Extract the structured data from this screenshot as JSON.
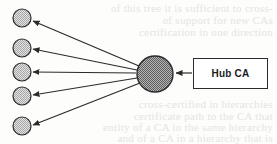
{
  "figure": {
    "background_color": "#fdfdfc",
    "stroke_color": "#2b2b2b",
    "hub_fill": "#8f8f8f",
    "spoke_fill": "#c9c9c9"
  },
  "hub": {
    "label": "Hub CA",
    "node_name": "hub-ca-node",
    "cx": 155,
    "cy": 74,
    "r": 18,
    "fill": "#8f8f8f"
  },
  "hub_label_box": {
    "text": "Hub CA",
    "x": 193,
    "y": 58,
    "width": 75,
    "height": 31
  },
  "spokes": [
    {
      "id": "spoke-1",
      "cx": 22,
      "cy": 18,
      "r": 9,
      "fill": "#c9c9c9"
    },
    {
      "id": "spoke-2",
      "cx": 22,
      "cy": 48,
      "r": 9,
      "fill": "#c9c9c9"
    },
    {
      "id": "spoke-3",
      "cx": 22,
      "cy": 72,
      "r": 9,
      "fill": "#c9c9c9"
    },
    {
      "id": "spoke-4",
      "cx": 22,
      "cy": 96,
      "r": 9,
      "fill": "#c9c9c9"
    },
    {
      "id": "spoke-5",
      "cx": 22,
      "cy": 126,
      "r": 9,
      "fill": "#c9c9c9"
    }
  ],
  "arrows": [
    {
      "id": "arrow-hub-to-spoke-1",
      "from": "hub",
      "to": "spoke-1"
    },
    {
      "id": "arrow-hub-to-spoke-2",
      "from": "hub",
      "to": "spoke-2"
    },
    {
      "id": "arrow-hub-to-spoke-3",
      "from": "hub",
      "to": "spoke-3"
    },
    {
      "id": "arrow-hub-to-spoke-4",
      "from": "hub",
      "to": "spoke-4"
    },
    {
      "id": "arrow-hub-to-spoke-5",
      "from": "hub",
      "to": "spoke-5"
    },
    {
      "id": "arrow-label-to-hub",
      "from": "hub_label_box",
      "to": "hub"
    }
  ],
  "bleed_text": {
    "note": "faint show-through text from the reverse side of the scanned page, largely illegible",
    "lines": [
      "of this tree it is sufficient to cross-",
      "of support for new CAs",
      "certification in one direction",
      "",
      "",
      "",
      "",
      "",
      "cross-certified in hierarchies",
      "certificate path to the CA that",
      "entity of a CA in the same hierarchy",
      "and of a CA in a hierarchy that is"
    ]
  }
}
